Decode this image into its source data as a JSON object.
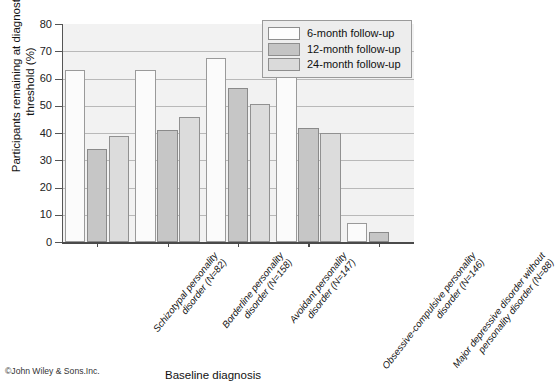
{
  "chart_data": {
    "type": "bar",
    "title": "",
    "xlabel": "Baseline diagnosis",
    "ylabel": "Participants remaining at diagnostic threshold (%)",
    "ylim": [
      0,
      80
    ],
    "yticks": [
      0,
      10,
      20,
      30,
      40,
      50,
      60,
      70,
      80
    ],
    "grid": true,
    "legend_position": "top-right",
    "categories": [
      "Schizotypal personality disorder (N=82)",
      "Borderline personality disorder (N=158)",
      "Avoidant personality disorder (N=147)",
      "Obsessive-compulsive personality disorder (N=146)",
      "Major depressive disorder without personality disorder (N=88)"
    ],
    "series": [
      {
        "name": "6-month follow-up",
        "values": [
          63,
          63,
          67.5,
          63,
          7
        ]
      },
      {
        "name": "12-month follow-up",
        "values": [
          34,
          41,
          56.5,
          42,
          3.5
        ]
      },
      {
        "name": "24-month follow-up",
        "values": [
          39,
          46,
          50.5,
          40,
          0
        ]
      }
    ]
  },
  "credit": "©John Wiley & Sons.Inc."
}
